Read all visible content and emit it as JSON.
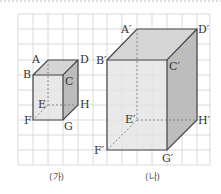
{
  "figures": [
    {
      "caption": "(가)",
      "vertices": {
        "A": "A",
        "B": "B",
        "C": "C",
        "D": "D",
        "E": "E",
        "F": "F",
        "G": "G",
        "H": "H"
      }
    },
    {
      "caption": "(나)",
      "vertices": {
        "A": "A′",
        "B": "B′",
        "C": "C′",
        "D": "D′",
        "E": "E′",
        "F": "F′",
        "G": "G′",
        "H": "H′"
      }
    }
  ],
  "colors": {
    "grid": "#cfcfcf",
    "edge": "#444444",
    "front": "#e4e4e4",
    "side": "#bdbdbd",
    "top": "#d6d6d6"
  }
}
